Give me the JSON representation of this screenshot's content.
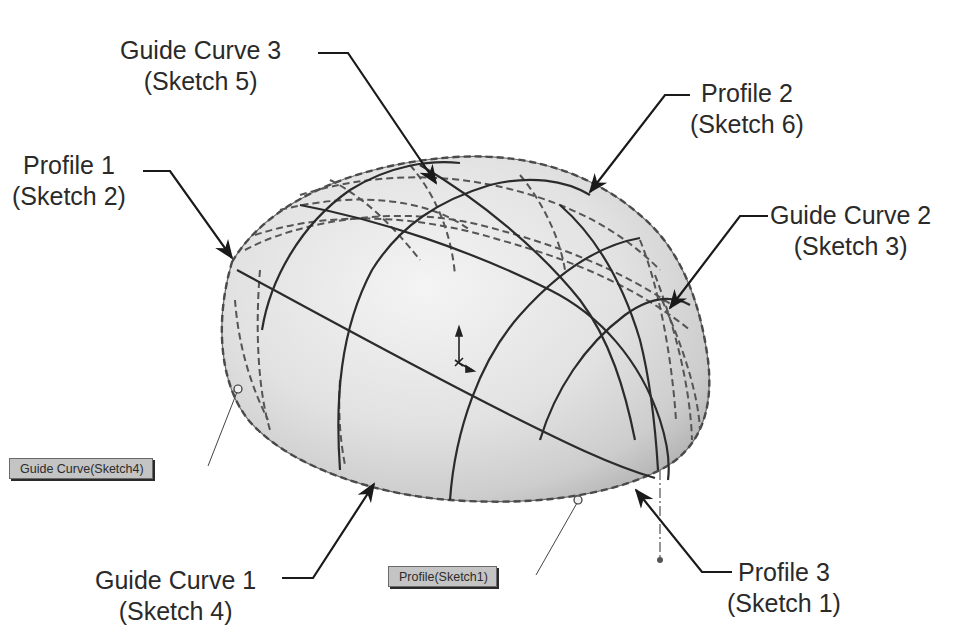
{
  "figure": {
    "type": "CAD loft feature annotation",
    "colors": {
      "background": "#ffffff",
      "surface_light": "#f0f0f0",
      "surface_dark": "#b8b8b8",
      "curve_solid": "#2b2b2b",
      "curve_dashed": "#555555",
      "leader": "#1a1a1a",
      "callout_bg": "#c4c4c4",
      "label_text": "#2a2a2a"
    }
  },
  "labels": {
    "guide_curve_3": {
      "title": "Guide Curve 3",
      "sketch": "(Sketch 5)"
    },
    "profile_1": {
      "title": "Profile 1",
      "sketch": "(Sketch 2)"
    },
    "profile_2": {
      "title": "Profile 2",
      "sketch": "(Sketch 6)"
    },
    "guide_curve_2": {
      "title": "Guide Curve 2",
      "sketch": "(Sketch 3)"
    },
    "guide_curve_1": {
      "title": "Guide Curve 1",
      "sketch": "(Sketch 4)"
    },
    "profile_3": {
      "title": "Profile 3",
      "sketch": "(Sketch 1)"
    }
  },
  "callouts": {
    "guide_curve_tag": "Guide Curve(Sketch4)",
    "profile_tag": "Profile(Sketch1)"
  },
  "icons": {
    "origin_triad": "coordinate-axes-icon"
  }
}
